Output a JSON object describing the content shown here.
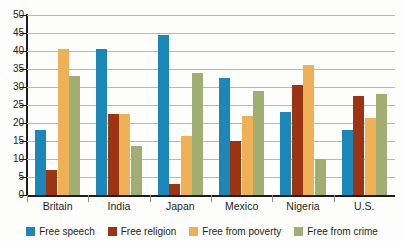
{
  "chart_data": {
    "type": "bar",
    "title": "",
    "xlabel": "",
    "ylabel": "",
    "ylim": [
      0,
      50
    ],
    "ytick_step": 5,
    "yticks": [
      50,
      45,
      40,
      35,
      30,
      25,
      20,
      15,
      10,
      5,
      0
    ],
    "grid": true,
    "legend_position": "bottom",
    "categories": [
      "Britain",
      "India",
      "Japan",
      "Mexico",
      "Nigeria",
      "U.S."
    ],
    "series": [
      {
        "name": "Free speech",
        "color": "#1b87b8",
        "values": [
          18,
          40.5,
          44.5,
          32.5,
          23,
          18
        ]
      },
      {
        "name": "Free religion",
        "color": "#9c3312",
        "values": [
          7,
          22.5,
          3,
          15,
          30.5,
          27.5
        ]
      },
      {
        "name": "Free from poverty",
        "color": "#eeb155",
        "values": [
          40.5,
          22.5,
          16.5,
          22,
          36,
          21.5
        ]
      },
      {
        "name": "Free from crime",
        "color": "#a0ae72",
        "values": [
          33,
          13.5,
          34,
          29,
          10,
          28
        ]
      }
    ]
  },
  "axis": {
    "ytick_labels": [
      "50",
      "45",
      "40",
      "35",
      "30",
      "25",
      "20",
      "15",
      "10",
      "5",
      "0"
    ],
    "xtick_labels": [
      "Britain",
      "India",
      "Japan",
      "Mexico",
      "Nigeria",
      "U.S."
    ]
  },
  "legend": {
    "items": [
      {
        "label": "Free speech",
        "color": "#1b87b8"
      },
      {
        "label": "Free religion",
        "color": "#9c3312"
      },
      {
        "label": "Free from poverty",
        "color": "#eeb155"
      },
      {
        "label": "Free from crime",
        "color": "#a0ae72"
      }
    ]
  },
  "colors": {
    "background": "#fdfdfb",
    "gridline": "#b9b9b9",
    "axis": "#1d1d1d",
    "text": "#1f1f1f"
  }
}
